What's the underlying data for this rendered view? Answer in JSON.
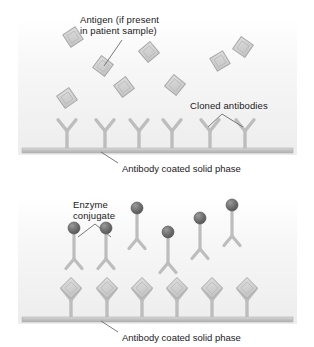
{
  "figure": {
    "panels": [
      {
        "id": "capture-step",
        "labels": {
          "antigen": "Antigen (if present\nin patient sample)",
          "cloned_antibodies": "Cloned antibodies"
        },
        "caption": "Antibody coated solid phase"
      },
      {
        "id": "detection-step",
        "labels": {
          "enzyme_conjugate": "Enzyme\nconjugate"
        },
        "caption": "Antibody coated solid phase"
      }
    ]
  },
  "colors": {
    "antigen_fill": "#d2d2d2",
    "antigen_stroke": "#a8a8a8",
    "antibody": "#bdbdbd",
    "antibody_stroke": "#aaaaaa",
    "enzyme_sphere": "#6e6e6e",
    "solid_phase_bar": "#c9c9c9",
    "panel_background": "#f2f2f2",
    "text": "#1a1a1a",
    "leader_line": "#6b6b6b"
  },
  "elements": {
    "antigen_name": "antigen-diamond",
    "antibody_name": "cloned-antibody",
    "conjugate_name": "enzyme-conjugate",
    "solid_phase_name": "solid-phase-bar"
  },
  "panel_top": {
    "free_antigens": [
      {
        "x": 73,
        "y": 37,
        "size": 21,
        "rot": 12
      },
      {
        "x": 103,
        "y": 66,
        "size": 21,
        "rot": -8
      },
      {
        "x": 149,
        "y": 52,
        "size": 21,
        "rot": 5
      },
      {
        "x": 220,
        "y": 61,
        "size": 21,
        "rot": 14
      },
      {
        "x": 243,
        "y": 47,
        "size": 21,
        "rot": -10
      },
      {
        "x": 124,
        "y": 87,
        "size": 21,
        "rot": 8
      },
      {
        "x": 175,
        "y": 85,
        "size": 21,
        "rot": -6
      },
      {
        "x": 67,
        "y": 98,
        "size": 21,
        "rot": 10
      }
    ],
    "antibodies": [
      {
        "x": 67
      },
      {
        "x": 105
      },
      {
        "x": 139
      },
      {
        "x": 172
      },
      {
        "x": 210
      },
      {
        "x": 245
      }
    ],
    "bar": {
      "x": 22,
      "y": 148,
      "width": 271,
      "height": 5
    },
    "antigen_label_pos": {
      "x": 80,
      "y": 14
    },
    "antigen_leader": {
      "x1": 122,
      "y1": 40,
      "x2": 104,
      "y2": 66
    },
    "cloned_label_pos": {
      "x": 190,
      "y": 100
    },
    "cloned_bracket": {
      "apex_x": 222,
      "apex_y": 114,
      "left_x": 208,
      "left_y": 127,
      "right_x": 243,
      "right_y": 127
    },
    "caption_pos": {
      "x": 122,
      "y": 163
    },
    "caption_leader": {
      "x1": 118,
      "y1": 163,
      "x2": 101,
      "y2": 152
    }
  },
  "panel_bottom": {
    "free_conjugates": [
      {
        "x": 74,
        "y": 228,
        "sphere": 10
      },
      {
        "x": 106,
        "y": 228,
        "sphere": 10
      },
      {
        "x": 137,
        "y": 208,
        "sphere": 10
      },
      {
        "x": 168,
        "y": 232,
        "sphere": 10
      },
      {
        "x": 200,
        "y": 218,
        "sphere": 10
      },
      {
        "x": 232,
        "y": 205,
        "sphere": 10
      }
    ],
    "bound_complexes": [
      {
        "x": 71
      },
      {
        "x": 107
      },
      {
        "x": 142
      },
      {
        "x": 177
      },
      {
        "x": 212
      },
      {
        "x": 247
      }
    ],
    "bar": {
      "x": 22,
      "y": 317,
      "width": 271,
      "height": 5
    },
    "enzyme_label_pos": {
      "x": 73,
      "y": 199
    },
    "enzyme_bracket": {
      "apex_x": 95,
      "apex_y": 224,
      "left_x": 78,
      "left_y": 237,
      "right_x": 111,
      "right_y": 237
    },
    "caption_pos": {
      "x": 122,
      "y": 332
    },
    "caption_leader": {
      "x1": 118,
      "y1": 332,
      "x2": 101,
      "y2": 321
    }
  }
}
